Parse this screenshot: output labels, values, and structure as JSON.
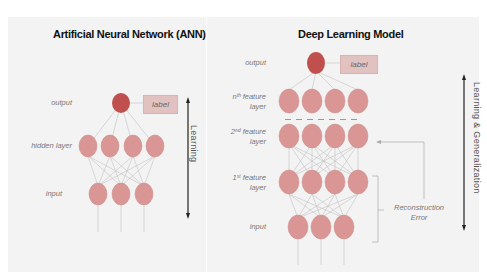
{
  "left_panel": {
    "title": "Artificial Neural Network (ANN)",
    "labels": {
      "output": "output",
      "hidden": "hidden layer",
      "input": "input"
    },
    "label_box": "label",
    "arrow_text": "Learning"
  },
  "right_panel": {
    "title": "Deep Learning Model",
    "labels": {
      "output": "output",
      "nth_line1": "nᵗʰ feature",
      "nth_line2": "layer",
      "second_line1": "2ⁿᵈ feature",
      "second_line2": "layer",
      "first_line1": "1ˢᵗ feature",
      "first_line2": "layer",
      "input": "input"
    },
    "label_box": "label",
    "reconstruction_line1": "Reconstruction",
    "reconstruction_line2": "Error",
    "arrow_text": "Learning & Generalization"
  },
  "colors": {
    "output_node": "#c0504d",
    "hidden_node": "#d99694",
    "label_box": "#e2c2c0",
    "panel_bg": "#f3f3f3"
  }
}
